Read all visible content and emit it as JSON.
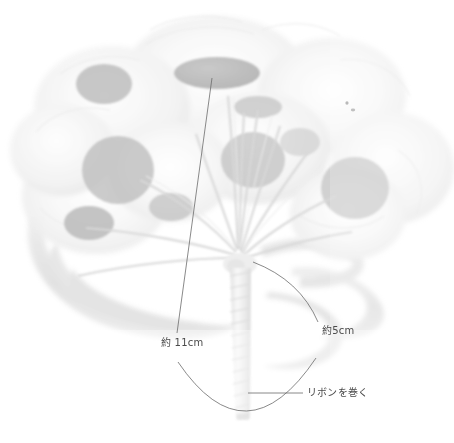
{
  "image": {
    "kind": "photograph",
    "subject": "flower-bouquet",
    "description": "washed-out grayscale photo of a round bouquet of flowers with ribbon loops and a ribbon-wrapped handle",
    "width": 454,
    "height": 443,
    "background_color": "#ffffff"
  },
  "palette": {
    "background": "#ffffff",
    "petal_light": "#f4f4f4",
    "petal_mid": "#e6e6e6",
    "flower_center": "#9d9d9d",
    "flower_center_dark": "#8f8f8f",
    "ribbon": "#dcdcdc",
    "ribbon_shade": "#cfcfcf",
    "stem": "#d2d2d2",
    "handle": "#e2e2e2",
    "leader_line": "#6b6b6b",
    "label_text": "#4a4a4a"
  },
  "annotations": [
    {
      "id": "length-11cm",
      "text": "約 11cm",
      "measures": "stem length from flower head to binding point",
      "label_x": 161,
      "label_y": 337,
      "leader": {
        "type": "line",
        "from": [
          212,
          78
        ],
        "to": [
          177,
          333
        ]
      }
    },
    {
      "id": "length-5cm",
      "text": "約5cm",
      "measures": "handle length below binding point",
      "label_x": 322,
      "label_y": 325,
      "leader": {
        "type": "curve",
        "from": [
          253,
          262
        ],
        "control": [
          300,
          280
        ],
        "to": [
          318,
          322
        ]
      }
    },
    {
      "id": "wrap-ribbon",
      "text": "リボンを巻く",
      "measures": "instruction to wrap the handle with ribbon",
      "label_x": 307,
      "label_y": 387,
      "leader": {
        "type": "line",
        "from": [
          248,
          393
        ],
        "to": [
          303,
          393
        ]
      },
      "callout_arc": {
        "type": "arc",
        "from": [
          178,
          362
        ],
        "control": [
          246,
          462
        ],
        "to": [
          316,
          358
        ]
      }
    }
  ],
  "flower_centers": [
    {
      "cx": 217,
      "cy": 73,
      "rx": 43,
      "ry": 16
    },
    {
      "cx": 104,
      "cy": 84,
      "rx": 28,
      "ry": 20
    },
    {
      "cx": 118,
      "cy": 170,
      "rx": 36,
      "ry": 34
    },
    {
      "cx": 89,
      "cy": 223,
      "rx": 25,
      "ry": 17
    },
    {
      "cx": 258,
      "cy": 107,
      "rx": 24,
      "ry": 11
    },
    {
      "cx": 253,
      "cy": 160,
      "rx": 32,
      "ry": 28
    },
    {
      "cx": 355,
      "cy": 188,
      "rx": 34,
      "ry": 31
    },
    {
      "cx": 171,
      "cy": 207,
      "rx": 22,
      "ry": 14
    }
  ]
}
